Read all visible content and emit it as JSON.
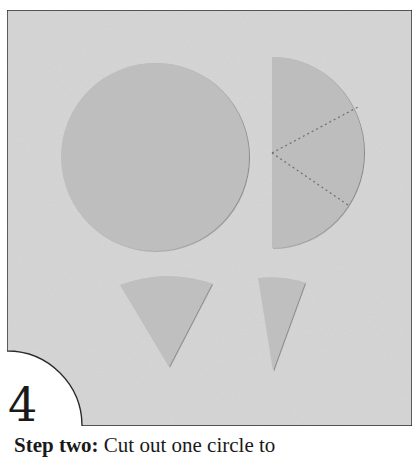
{
  "figure": {
    "step_number": "4",
    "caption": {
      "bold_part": "Step two:",
      "rest": " Cut out one circle to"
    },
    "colors": {
      "paper_background": "#d4d4d4",
      "shape_fill": "#bdbdbd",
      "border": "#2a2a2a",
      "dotted_line": "#707070"
    },
    "shapes": [
      {
        "name": "full-circle",
        "description": "Cut-out paper circle"
      },
      {
        "name": "half-circle",
        "description": "Semicircle divided into three sectors by dotted lines"
      },
      {
        "name": "wide-wedge",
        "description": "Cut-out wide cone wedge"
      },
      {
        "name": "narrow-wedge",
        "description": "Cut-out narrow cone wedge"
      }
    ]
  }
}
